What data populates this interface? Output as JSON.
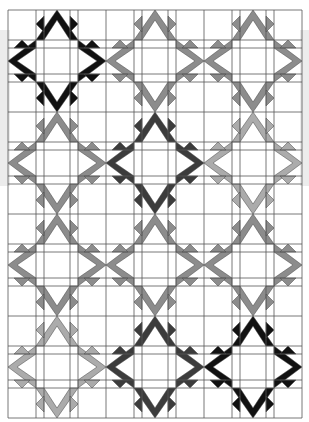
{
  "grid": {
    "rows": 4,
    "cols": 3
  },
  "palette": {
    "black": "#111111",
    "dark": "#3c3c3c",
    "mid": "#8c8c8c",
    "light": "#ababab",
    "line": "#555555",
    "background": "#ffffff"
  },
  "blocks": [
    [
      "black",
      "mid",
      "mid"
    ],
    [
      "mid",
      "dark",
      "light"
    ],
    [
      "mid",
      "mid",
      "mid"
    ],
    [
      "light",
      "dark",
      "black"
    ]
  ],
  "connectors": {
    "horizontal": [
      [
        "mid",
        "mid"
      ],
      [
        "mid",
        "light"
      ],
      [
        "mid",
        "mid"
      ],
      [
        "dark",
        "black"
      ]
    ],
    "vertical": [
      [
        "mid",
        "dark",
        "light"
      ],
      [
        "mid",
        "dark",
        "light"
      ],
      [
        "mid",
        "mid",
        "black"
      ]
    ]
  }
}
